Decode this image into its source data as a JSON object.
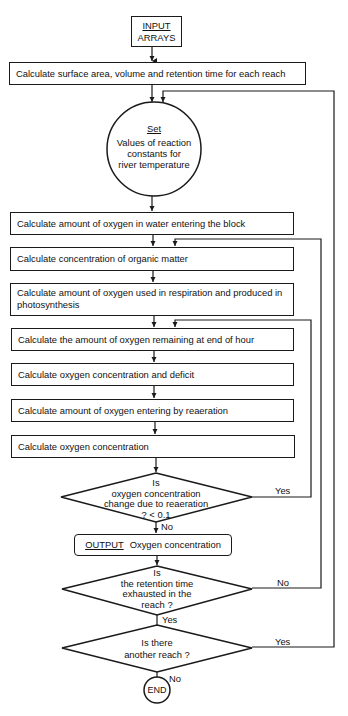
{
  "flowchart": {
    "input": {
      "title": "INPUT",
      "subtitle": "ARRAYS"
    },
    "steps": [
      "Calculate surface area, volume and retention time for each reach",
      "Calculate amount of oxygen in water entering the block",
      "Calculate concentration of organic matter",
      "Calculate amount of oxygen used in respiration and produced in photosynthesis",
      "Calculate the amount  of oxygen remaining at end of hour",
      "Calculate oxygen concentration and deficit",
      "Calculate amount of oxygen entering by reaeration",
      "Calculate oxygen concentration"
    ],
    "set_circle": {
      "title": "Set",
      "line1": "Values of reaction",
      "line2": "constants for",
      "line3": "river temperature"
    },
    "decision1": {
      "line1": "Is",
      "line2": "oxygen concentration",
      "line3": "change due to reaeration",
      "line4": "? < 0.1",
      "yes": "Yes",
      "no": "No"
    },
    "output": {
      "keyword": "OUTPUT",
      "text": "Oxygen concentration"
    },
    "decision2": {
      "line1": "Is",
      "line2": "the retention time",
      "line3": "exhausted in the",
      "line4": "reach ?",
      "no": "No",
      "yes": "Yes"
    },
    "decision3": {
      "line1": "Is there",
      "line2": "another reach ?",
      "yes": "Yes",
      "no": "No"
    },
    "end": "END"
  }
}
